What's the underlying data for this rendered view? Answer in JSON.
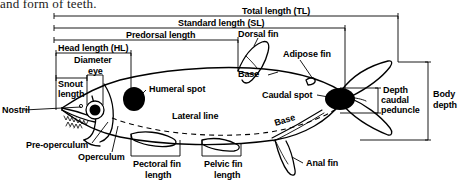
{
  "caption": {
    "text": "and form of teeth."
  },
  "diagram": {
    "line_color": "#000000",
    "spot_color": "#000000",
    "background": "#ffffff"
  },
  "measurements": [
    {
      "id": "total-length",
      "label": "Total length (TL)",
      "orientation": "horizontal",
      "span": "snout tip to tip of caudal fin"
    },
    {
      "id": "standard-length",
      "label": "Standard length (SL)",
      "orientation": "horizontal",
      "span": "snout tip to caudal peduncle"
    },
    {
      "id": "predorsal-length",
      "label": "Predorsal length",
      "orientation": "horizontal",
      "span": "snout tip to dorsal fin origin"
    },
    {
      "id": "head-length",
      "label": "Head length (HL)",
      "orientation": "horizontal",
      "span": "snout tip to rear of operculum"
    },
    {
      "id": "diameter-eye",
      "label": "Diameter eye",
      "orientation": "horizontal",
      "span": "eye diameter"
    },
    {
      "id": "snout-length",
      "label": "Snout length",
      "orientation": "horizontal",
      "span": "snout tip to front of eye"
    },
    {
      "id": "pectoral-fin-length",
      "label": "Pectoral fin length",
      "orientation": "horizontal",
      "span": "pectoral fin base to tip"
    },
    {
      "id": "pelvic-fin-length",
      "label": "Pelvic fin length",
      "orientation": "horizontal",
      "span": "pelvic fin base to tip"
    },
    {
      "id": "body-depth",
      "label": "Body depth",
      "orientation": "vertical",
      "span": "maximum dorsal to ventral depth"
    },
    {
      "id": "depth-caudal-peduncle",
      "label": "Depth caudal peduncle",
      "orientation": "vertical",
      "span": "least depth of caudal peduncle"
    }
  ],
  "anatomy_labels": [
    {
      "id": "dorsal-fin",
      "label": "Dorsal fin"
    },
    {
      "id": "adipose-fin",
      "label": "Adipose fin"
    },
    {
      "id": "dorsal-base",
      "label": "Base"
    },
    {
      "id": "anal-base",
      "label": "Base"
    },
    {
      "id": "humeral-spot",
      "label": "Humeral spot"
    },
    {
      "id": "caudal-spot",
      "label": "Caudal spot"
    },
    {
      "id": "lateral-line",
      "label": "Lateral line"
    },
    {
      "id": "nostril",
      "label": "Nostril"
    },
    {
      "id": "pre-operculum",
      "label": "Pre-operculum"
    },
    {
      "id": "operculum",
      "label": "Operculum"
    },
    {
      "id": "anal-fin",
      "label": "Anal fin"
    }
  ],
  "label_text": {
    "total_length": "Total length (TL)",
    "standard_length": "Standard length (SL)",
    "predorsal_length": "Predorsal length",
    "head_length": "Head length (HL)",
    "diameter": "Diameter",
    "eye": "eye",
    "snout": "Snout",
    "length": "length",
    "dorsal_fin": "Dorsal fin",
    "adipose_fin": "Adipose fin",
    "base_dorsal": "Base",
    "base_anal": "Base",
    "humeral_spot": "Humeral spot",
    "caudal_spot": "Caudal spot",
    "lateral_line": "Lateral line",
    "nostril": "Nostril",
    "pre_operculum": "Pre-operculum",
    "operculum": "Operculum",
    "pectoral_fin": "Pectoral fin",
    "pectoral_length": "length",
    "pelvic_fin": "Pelvic fin",
    "pelvic_length": "length",
    "anal_fin": "Anal fin",
    "depth": "Depth",
    "caudal": "caudal",
    "peduncle": "peduncle",
    "body": "Body",
    "body_depth": "depth"
  }
}
